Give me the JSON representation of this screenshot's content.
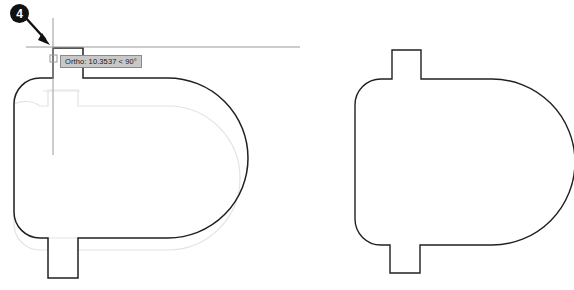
{
  "app": {
    "title": "CAD Drawing Editor — Ortho Stretch Operation",
    "background_color": "#ffffff"
  },
  "colors": {
    "outline": "#231f20",
    "ghost_outline": "#e3e3e3",
    "crosshair": "#9a9a9a",
    "tooltip_bg": "#c8c8c8",
    "tooltip_border": "#8a8a8a",
    "tooltip_text": "#1a1a1a",
    "callout_bg": "#111111",
    "callout_text": "#ffffff",
    "arrow": "#111111"
  },
  "callout": {
    "number": "4",
    "name": "step-marker"
  },
  "tooltip": {
    "text": "Ortho: 10.3537 < 90°",
    "mode_label": "Ortho:",
    "distance": "10.3537",
    "angle_symbol": "<",
    "angle": "90°"
  },
  "cursor": {
    "x": 53,
    "y": 47,
    "pickbox_size": 7,
    "label": "crosshair-cursor"
  },
  "shapes": [
    {
      "id": "left-shape",
      "name": "part-outline-during-stretch",
      "has_ghost": true,
      "ghost_offset_y": 26,
      "bounds": {
        "x": 14,
        "y": 48,
        "width": 212,
        "height": 230
      },
      "top_tab": {
        "x": 53,
        "y": 48,
        "width": 30,
        "height": 30
      },
      "bottom_tab": {
        "x": 48,
        "y": 238,
        "width": 30,
        "height": 40
      }
    },
    {
      "id": "right-shape",
      "name": "part-outline-final",
      "has_ghost": false,
      "bounds": {
        "x": 355,
        "y": 50,
        "width": 196,
        "height": 223
      },
      "top_tab": {
        "x": 392,
        "y": 50,
        "width": 29,
        "height": 28
      },
      "bottom_tab": {
        "x": 390,
        "y": 245,
        "width": 30,
        "height": 28
      }
    }
  ],
  "arrow": {
    "name": "callout-pointer",
    "from_x": 26,
    "from_y": 18,
    "to_x": 48,
    "to_y": 42
  }
}
